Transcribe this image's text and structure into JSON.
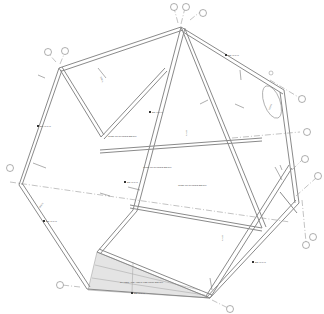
{
  "drawing": {
    "type": "framing-plan",
    "grid_bubbles": [
      "A",
      "B",
      "C",
      "D",
      "E",
      "F",
      "G",
      "H",
      "J",
      "K",
      "L",
      "M",
      "N"
    ],
    "room_labels": [
      "OPEN TO OUTSIDE BELOW",
      "OPEN TO OUTSIDE BELOW",
      "OPEN TO OUTSIDE BELOW"
    ],
    "beam_tags": [
      "BEAM TYP",
      "BEAM TYP",
      "BEAM TYP",
      "BEAM TYP",
      "BEAM TYP",
      "BEAM TYP",
      "BEAM TYP",
      "BEAM TYP"
    ],
    "hatched_area_label": "SHADED AREA INDICATES ROOF BELOW",
    "span_labels": [
      "SPAN",
      "SPAN",
      "SPAN",
      "SPAN",
      "SPAN"
    ],
    "colors": {
      "line": "#8a8a8a",
      "hatch": "#e4e4e4",
      "background": "#ffffff"
    }
  }
}
